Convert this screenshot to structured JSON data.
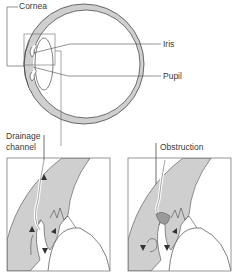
{
  "diagram": {
    "type": "anatomical-eye-cross-section",
    "labels": {
      "cornea": "Cornea",
      "iris": "Iris",
      "pupil": "Pupil",
      "drainage_line1": "Drainage",
      "drainage_line2": "channel",
      "obstruction": "Obstruction"
    },
    "panels": [
      {
        "id": "normal",
        "caption": "Drainage channel",
        "state": "open"
      },
      {
        "id": "blocked",
        "caption": "Obstruction",
        "state": "obstructed"
      }
    ],
    "colors": {
      "tissue_fill": "#cfcfcf",
      "line": "#4a4a4a",
      "obstruction_fill": "#9a9a9a",
      "background": "#ffffff"
    }
  }
}
